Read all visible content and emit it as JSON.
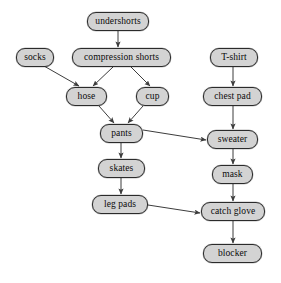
{
  "diagram": {
    "type": "directed-acyclic-graph",
    "background_color": "#ffffff",
    "node_fill_color": "#d3d3d3",
    "node_border_color": "#2b2b2b",
    "edge_color": "#3c3c3c",
    "text_color": "#0a0a0a",
    "nodes": [
      {
        "id": "undershorts",
        "label": "undershorts",
        "x": 87,
        "y": 12,
        "w": 62,
        "h": 19
      },
      {
        "id": "socks",
        "label": "socks",
        "x": 16,
        "y": 48,
        "w": 38,
        "h": 19
      },
      {
        "id": "compression-shorts",
        "label": "compression shorts",
        "x": 72,
        "y": 48,
        "w": 99,
        "h": 19
      },
      {
        "id": "t-shirt",
        "label": "T-shirt",
        "x": 210,
        "y": 48,
        "w": 48,
        "h": 19
      },
      {
        "id": "hose",
        "label": "hose",
        "x": 66,
        "y": 87,
        "w": 41,
        "h": 19
      },
      {
        "id": "cup",
        "label": "cup",
        "x": 136,
        "y": 87,
        "w": 33,
        "h": 19
      },
      {
        "id": "chest-pad",
        "label": "chest pad",
        "x": 203,
        "y": 87,
        "w": 59,
        "h": 19
      },
      {
        "id": "pants",
        "label": "pants",
        "x": 100,
        "y": 124,
        "w": 43,
        "h": 19
      },
      {
        "id": "sweater",
        "label": "sweater",
        "x": 207,
        "y": 130,
        "w": 51,
        "h": 19
      },
      {
        "id": "skates",
        "label": "skates",
        "x": 98,
        "y": 159,
        "w": 47,
        "h": 19
      },
      {
        "id": "mask",
        "label": "mask",
        "x": 212,
        "y": 165,
        "w": 41,
        "h": 19
      },
      {
        "id": "leg-pads",
        "label": "leg pads",
        "x": 92,
        "y": 195,
        "w": 56,
        "h": 19
      },
      {
        "id": "catch-glove",
        "label": "catch glove",
        "x": 201,
        "y": 202,
        "w": 64,
        "h": 19
      },
      {
        "id": "blocker",
        "label": "blocker",
        "x": 203,
        "y": 244,
        "w": 59,
        "h": 19
      }
    ],
    "edges": [
      {
        "from": "undershorts",
        "to": "compression-shorts",
        "x1": 118,
        "y1": 31,
        "x2": 118,
        "y2": 47
      },
      {
        "from": "socks",
        "to": "hose",
        "x1": 44,
        "y1": 66,
        "x2": 79,
        "y2": 86
      },
      {
        "from": "compression-shorts",
        "to": "hose",
        "x1": 113,
        "y1": 67,
        "x2": 93,
        "y2": 86
      },
      {
        "from": "compression-shorts",
        "to": "cup",
        "x1": 131,
        "y1": 67,
        "x2": 150,
        "y2": 86
      },
      {
        "from": "hose",
        "to": "pants",
        "x1": 99,
        "y1": 106,
        "x2": 114,
        "y2": 123
      },
      {
        "from": "cup",
        "to": "pants",
        "x1": 143,
        "y1": 106,
        "x2": 128,
        "y2": 123
      },
      {
        "from": "pants",
        "to": "skates",
        "x1": 121,
        "y1": 143,
        "x2": 121,
        "y2": 158
      },
      {
        "from": "pants",
        "to": "sweater",
        "x1": 143,
        "y1": 130,
        "x2": 206,
        "y2": 140
      },
      {
        "from": "skates",
        "to": "leg-pads",
        "x1": 121,
        "y1": 178,
        "x2": 121,
        "y2": 194
      },
      {
        "from": "leg-pads",
        "to": "catch-glove",
        "x1": 148,
        "y1": 205,
        "x2": 200,
        "y2": 213
      },
      {
        "from": "t-shirt",
        "to": "chest-pad",
        "x1": 233,
        "y1": 67,
        "x2": 233,
        "y2": 86
      },
      {
        "from": "chest-pad",
        "to": "sweater",
        "x1": 233,
        "y1": 106,
        "x2": 233,
        "y2": 129
      },
      {
        "from": "sweater",
        "to": "mask",
        "x1": 233,
        "y1": 149,
        "x2": 233,
        "y2": 164
      },
      {
        "from": "mask",
        "to": "catch-glove",
        "x1": 233,
        "y1": 184,
        "x2": 233,
        "y2": 201
      },
      {
        "from": "catch-glove",
        "to": "blocker",
        "x1": 233,
        "y1": 221,
        "x2": 233,
        "y2": 243
      }
    ]
  }
}
